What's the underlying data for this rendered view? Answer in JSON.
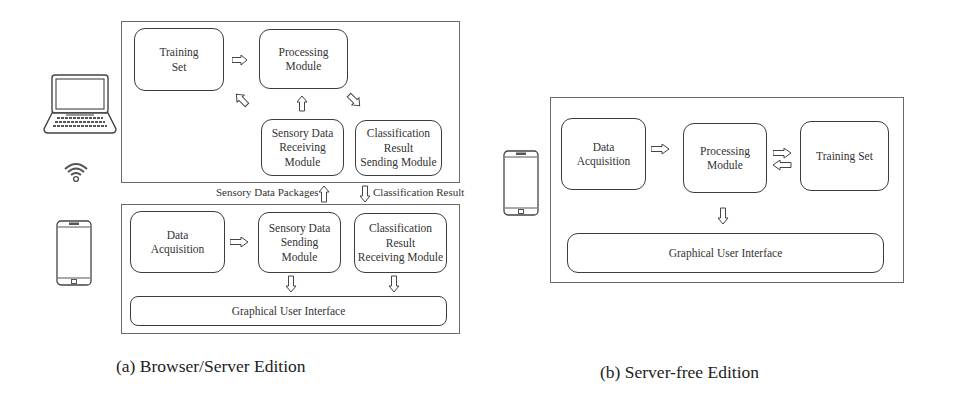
{
  "figure_a": {
    "caption": "(a) Browser/Server Edition",
    "server_panel": {
      "training_set": "Training\nSet",
      "processing_module": "Processing\nModule",
      "sensory_data_receiving_module": "Sensory Data\nReceiving\nModule",
      "classification_result_sending_module": "Classification\nResult\nSending Module"
    },
    "link_labels": {
      "sensory_data_packages": "Sensory Data Packages",
      "classification_result": "Classification Result"
    },
    "client_panel": {
      "data_acquisition": "Data\nAcquisition",
      "sensory_data_sending_module": "Sensory Data\nSending\nModule",
      "classification_result_receiving_module": "Classification\nResult\nReceiving Module",
      "graphical_user_interface": "Graphical User Interface"
    },
    "icons": [
      "laptop-icon",
      "wifi-icon",
      "smartphone-icon"
    ]
  },
  "figure_b": {
    "caption": "(b) Server-free Edition",
    "panel": {
      "data_acquisition": "Data\nAcquisition",
      "processing_module": "Processing\nModule",
      "training_set": "Training Set",
      "graphical_user_interface": "Graphical User Interface"
    },
    "icons": [
      "smartphone-icon"
    ]
  },
  "colors": {
    "stroke": "#3c3c3c",
    "frame": "#6a6a6a",
    "arrow_fill": "#ffffff",
    "text": "#333333"
  }
}
